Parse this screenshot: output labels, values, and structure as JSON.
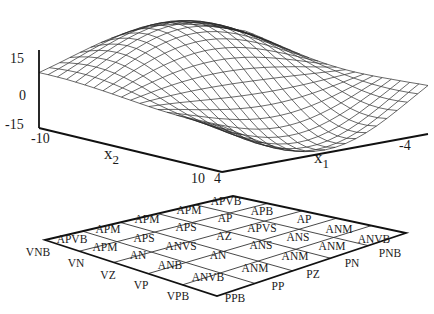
{
  "surface_plot": {
    "z_ticks": [
      "15",
      "0",
      "-15"
    ],
    "x2_axis": {
      "label": "x",
      "subscript": "2",
      "ticks": [
        "-10",
        "10"
      ]
    },
    "x1_axis": {
      "label": "x",
      "subscript": "1",
      "ticks": [
        "4",
        "-4"
      ]
    },
    "grid_resolution": 21
  },
  "rule_table": {
    "left_axis_labels": [
      "VNB",
      "VN",
      "VZ",
      "VP",
      "VPB"
    ],
    "right_axis_labels": [
      "PPB",
      "PP",
      "PZ",
      "PN",
      "PNB"
    ],
    "cells": [
      {
        "text": "APVB",
        "x": 72,
        "y": 243
      },
      {
        "text": "APM",
        "x": 108,
        "y": 233
      },
      {
        "text": "APM",
        "x": 147,
        "y": 223
      },
      {
        "text": "APM",
        "x": 189,
        "y": 214
      },
      {
        "text": "APVB",
        "x": 226,
        "y": 205
      },
      {
        "text": "APM",
        "x": 105,
        "y": 251
      },
      {
        "text": "APS",
        "x": 144,
        "y": 242
      },
      {
        "text": "APS",
        "x": 186,
        "y": 231
      },
      {
        "text": "AP",
        "x": 225,
        "y": 222
      },
      {
        "text": "APB",
        "x": 262,
        "y": 215
      },
      {
        "text": "AN",
        "x": 138,
        "y": 259
      },
      {
        "text": "ANVS",
        "x": 181,
        "y": 250
      },
      {
        "text": "AZ",
        "x": 224,
        "y": 240
      },
      {
        "text": "APVS",
        "x": 262,
        "y": 232
      },
      {
        "text": "AP",
        "x": 304,
        "y": 223
      },
      {
        "text": "ANB",
        "x": 170,
        "y": 269
      },
      {
        "text": "AN",
        "x": 218,
        "y": 259
      },
      {
        "text": "ANS",
        "x": 261,
        "y": 249
      },
      {
        "text": "ANS",
        "x": 298,
        "y": 241
      },
      {
        "text": "ANM",
        "x": 339,
        "y": 233
      },
      {
        "text": "ANVB",
        "x": 208,
        "y": 281
      },
      {
        "text": "ANM",
        "x": 255,
        "y": 272
      },
      {
        "text": "ANM",
        "x": 295,
        "y": 260
      },
      {
        "text": "ANM",
        "x": 332,
        "y": 250
      },
      {
        "text": "ANVB",
        "x": 374,
        "y": 243
      }
    ],
    "left_label_positions": [
      {
        "text": "VNB",
        "x": 38,
        "y": 256
      },
      {
        "text": "VN",
        "x": 76,
        "y": 267
      },
      {
        "text": "VZ",
        "x": 108,
        "y": 279
      },
      {
        "text": "VP",
        "x": 141,
        "y": 289
      },
      {
        "text": "VPB",
        "x": 178,
        "y": 300
      }
    ],
    "right_label_positions": [
      {
        "text": "PPB",
        "x": 235,
        "y": 302
      },
      {
        "text": "PP",
        "x": 278,
        "y": 290
      },
      {
        "text": "PZ",
        "x": 313,
        "y": 278
      },
      {
        "text": "PN",
        "x": 352,
        "y": 267
      },
      {
        "text": "PNB",
        "x": 390,
        "y": 257
      }
    ]
  }
}
